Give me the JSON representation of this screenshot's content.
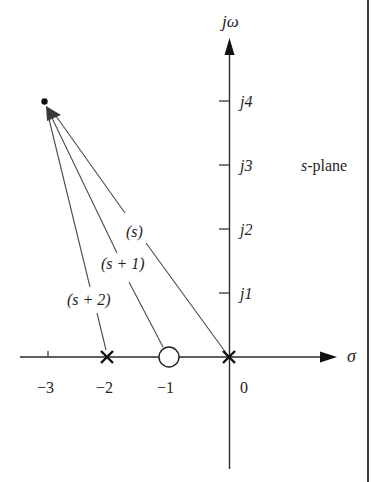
{
  "diagram": {
    "type": "s-plane pole-zero diagram",
    "plane_label": {
      "prefix": "s",
      "suffix": "-plane"
    },
    "axes": {
      "imaginary_label": "jω",
      "real_label": "σ",
      "real_ticks": [
        {
          "value": -3,
          "label": "−3"
        },
        {
          "value": -2,
          "label": "−2"
        },
        {
          "value": -1,
          "label": "−1"
        },
        {
          "value": 0,
          "label": "0"
        }
      ],
      "imag_ticks": [
        {
          "value": 1,
          "label": "j1"
        },
        {
          "value": 2,
          "label": "j2"
        },
        {
          "value": 3,
          "label": "j3"
        },
        {
          "value": 4,
          "label": "j4"
        }
      ]
    },
    "poles": [
      {
        "re": 0,
        "im": 0,
        "marker": "x"
      },
      {
        "re": -2,
        "im": 0,
        "marker": "x"
      }
    ],
    "zeros": [
      {
        "re": -1,
        "im": 0,
        "marker": "o"
      }
    ],
    "test_point": {
      "re": -3,
      "im": 4
    },
    "vectors": [
      {
        "from": "0",
        "label": "(s)"
      },
      {
        "from": "-1",
        "label": "(s + 1)"
      },
      {
        "from": "-2",
        "label": "(s + 2)"
      }
    ],
    "colors": {
      "ink": "#1e1e1e",
      "line": "#3a3a3a",
      "background": "#ffffff"
    }
  }
}
